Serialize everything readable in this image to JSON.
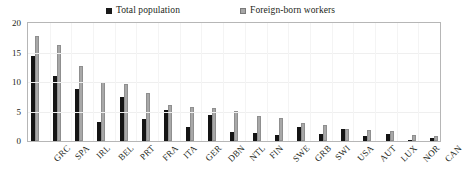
{
  "legend": {
    "total_label": "Total population",
    "foreign_label": "Foreign-born workers",
    "total_color": "#141414",
    "foreign_color": "#a8a8a8"
  },
  "axis": {
    "y_ticks": [
      "0",
      "5",
      "10",
      "15",
      "20"
    ],
    "y_min": 0,
    "y_max": 20
  },
  "chart_data": {
    "type": "bar",
    "title": "",
    "subtitle": "",
    "xlabel": "",
    "ylabel": "",
    "ylim": [
      0,
      20
    ],
    "yticks": [
      0,
      5,
      10,
      15,
      20
    ],
    "grid": true,
    "legend_position": "top",
    "categories": [
      "GRC",
      "SPA",
      "IRL",
      "BEL",
      "PRT",
      "FRA",
      "ITA",
      "GER",
      "DBN",
      "NTL",
      "FIN",
      "SWE",
      "GRB",
      "SWI",
      "USA",
      "AUT",
      "LUX",
      "NOR",
      "CAN"
    ],
    "series": [
      {
        "name": "Total population",
        "color": "#141414",
        "values": [
          14.4,
          11.0,
          8.9,
          3.2,
          7.4,
          3.8,
          5.3,
          2.3,
          4.4,
          1.5,
          1.4,
          1.1,
          2.4,
          1.2,
          2.1,
          0.8,
          1.2,
          0.1,
          0.5
        ]
      },
      {
        "name": "Foreign-born workers",
        "color": "#a8a8a8",
        "values": [
          17.8,
          16.2,
          12.7,
          10.0,
          9.7,
          8.1,
          6.1,
          5.7,
          5.6,
          5.1,
          4.2,
          3.9,
          3.0,
          2.7,
          2.1,
          1.9,
          1.7,
          1.0,
          0.8
        ]
      }
    ]
  }
}
